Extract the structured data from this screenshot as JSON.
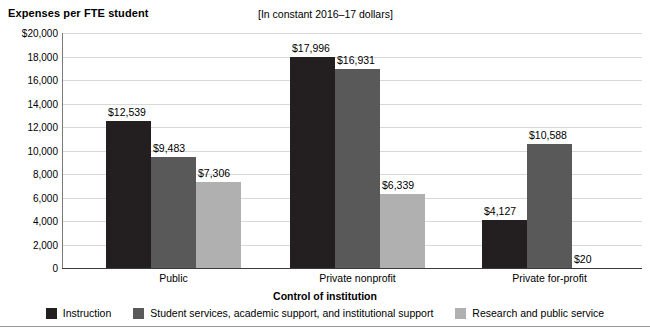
{
  "header": {
    "title": "Expenses per FTE student",
    "units_note": "[In constant 2016–17 dollars]"
  },
  "chart_data": {
    "type": "bar",
    "title": "Expenses per FTE student",
    "subtitle": "[In constant 2016–17 dollars]",
    "xlabel": "Control of institution",
    "ylabel": "",
    "ylim": [
      0,
      20000
    ],
    "ytick_labels": [
      "$20,000",
      "18,000",
      "16,000",
      "14,000",
      "12,000",
      "10,000",
      "8,000",
      "6,000",
      "4,000",
      "2,000",
      "0"
    ],
    "ytick_values": [
      20000,
      18000,
      16000,
      14000,
      12000,
      10000,
      8000,
      6000,
      4000,
      2000,
      0
    ],
    "grid": true,
    "legend_position": "bottom",
    "categories": [
      "Public",
      "Private nonprofit",
      "Private for-profit"
    ],
    "series": [
      {
        "name": "Instruction",
        "color": "#231f20",
        "values": [
          12539,
          17996,
          4127
        ],
        "labels": [
          "$12,539",
          "$17,996",
          "$4,127"
        ]
      },
      {
        "name": "Student services, academic support, and institutional support",
        "color": "#595959",
        "values": [
          9483,
          16931,
          10588
        ],
        "labels": [
          "$9,483",
          "$16,931",
          "$10,588"
        ]
      },
      {
        "name": "Research and public service",
        "color": "#b0b0b0",
        "values": [
          7306,
          6339,
          20
        ],
        "labels": [
          "$7,306",
          "$6,339",
          "$20"
        ]
      }
    ]
  }
}
